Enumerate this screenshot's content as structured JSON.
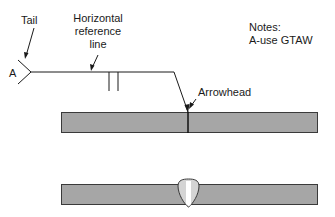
{
  "labels": {
    "tail": "Tail",
    "reference_line": [
      "Horizontal",
      "reference",
      "line"
    ],
    "arrowhead": "Arrowhead",
    "tail_note_letter": "A",
    "notes_title": "Notes:",
    "notes_line": "A-use GTAW"
  },
  "colors": {
    "plate_fill": "#a6a6a6",
    "plate_stroke": "#3a3a3a",
    "weld_fill": "#d4d4d4",
    "weld_center": "#ffffff",
    "line": "#1a1a1a"
  },
  "symbol": {
    "type": "square-groove weld symbol",
    "side": "arrow side"
  }
}
